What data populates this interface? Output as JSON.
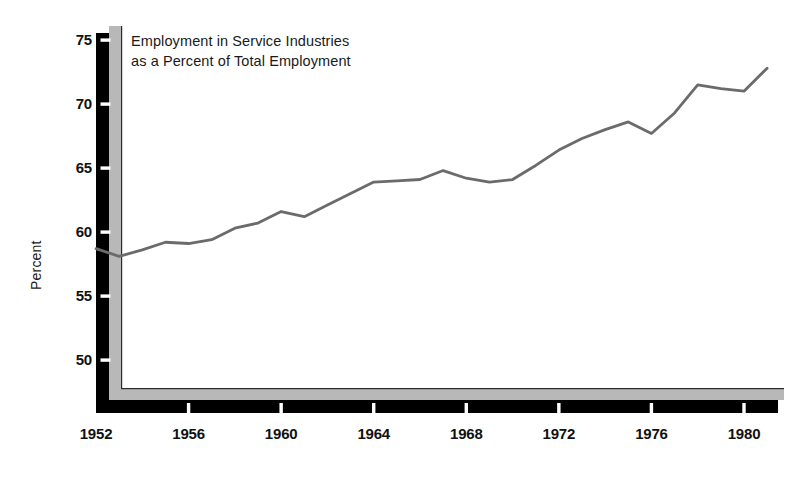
{
  "chart_data": {
    "type": "line",
    "title": "Employment in Service Industries as a Percent of Total Employment",
    "title_line1": "Employment in Service Industries",
    "title_line2": "as a Percent of Total Employment",
    "xlabel": "",
    "ylabel": "Percent",
    "ylim": [
      46.5,
      75
    ],
    "xlim": [
      1952,
      1981.5
    ],
    "grid": false,
    "legend": null,
    "y_ticks": [
      50,
      55,
      60,
      65,
      70,
      75
    ],
    "y_tick_labels": [
      "50",
      "55",
      "60",
      "65",
      "70",
      "75"
    ],
    "x_ticks": [
      1952,
      1956,
      1960,
      1964,
      1968,
      1972,
      1976,
      1980
    ],
    "x_tick_labels": [
      "1952",
      "1956",
      "1960",
      "1964",
      "1968",
      "1972",
      "1976",
      "1980"
    ],
    "series": [
      {
        "name": "Employment in Service Industries as a Percent of Total Employment",
        "color": "#6b6b6b",
        "x": [
          1952,
          1953,
          1954,
          1955,
          1956,
          1957,
          1958,
          1959,
          1960,
          1961,
          1962,
          1963,
          1964,
          1965,
          1966,
          1967,
          1968,
          1969,
          1970,
          1971,
          1972,
          1973,
          1974,
          1975,
          1976,
          1977,
          1978,
          1979,
          1980,
          1981
        ],
        "values": [
          58.7,
          58.1,
          58.6,
          59.2,
          59.1,
          59.4,
          60.3,
          60.7,
          61.6,
          61.2,
          62.1,
          63.0,
          63.9,
          64.0,
          64.1,
          64.8,
          64.2,
          63.9,
          64.1,
          65.2,
          66.4,
          67.3,
          68.0,
          68.6,
          67.7,
          69.3,
          71.5,
          71.2,
          71.0,
          72.8
        ]
      }
    ],
    "annotations": []
  },
  "axis_style": {
    "frame_color": "#000000",
    "frame_shadow_color": "#b8b8b8",
    "line_color": "#6b6b6b",
    "tick_gap_color": "#ffffff",
    "background": "#ffffff"
  }
}
